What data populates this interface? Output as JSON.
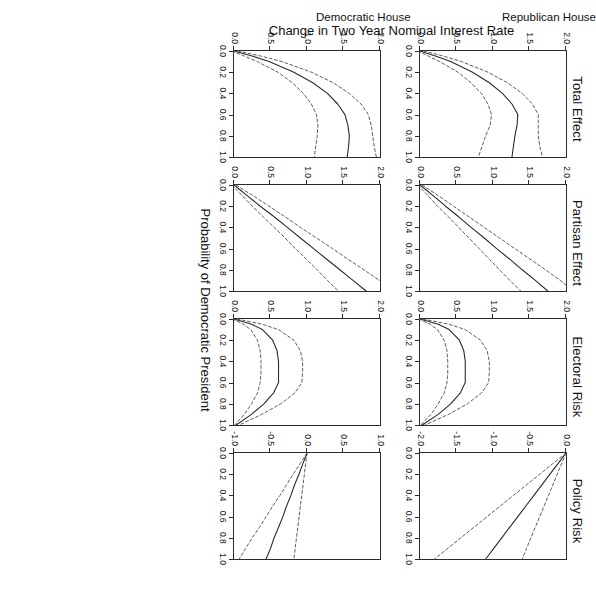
{
  "figure": {
    "xlabel": "Probability of Democratic President",
    "ylabel": "Change in Two Year Nominal Interest Rate",
    "rows": [
      {
        "id": "republican",
        "label_line1": "Republican House",
        "label_line2": ""
      },
      {
        "id": "democratic",
        "label_line1": "Democratic House",
        "label_line2": ""
      }
    ],
    "column_titles": [
      "Total Effect",
      "Partisan Effect",
      "Electoral Risk",
      "Policy Risk"
    ],
    "x_ticks": [
      "0.0",
      "0.2",
      "0.4",
      "0.6",
      "0.8",
      "1.0"
    ],
    "y_ticks_0_2": [
      "0.0",
      "0.5",
      "1.0",
      "1.5",
      "2.0"
    ],
    "y_ticks_neg2_0": [
      "0.0",
      "-0.5",
      "-1.0",
      "-1.5",
      "-2.0"
    ],
    "y_ticks_neg1_1": [
      "1.0",
      "0.5",
      "0.0",
      "-0.5",
      "-1.0"
    ],
    "line_color": "#2b2b2b",
    "band_color": "#555555"
  },
  "chart_data": {
    "type": "line",
    "title": "",
    "xlabel": "Probability of Democratic President",
    "ylabel": "Change in Two Year Nominal Interest Rate",
    "grid": false,
    "legend": "none",
    "xlim": [
      0,
      1
    ],
    "x": [
      0.0,
      0.05,
      0.1,
      0.2,
      0.3,
      0.4,
      0.5,
      0.6,
      0.7,
      0.8,
      0.9,
      1.0
    ],
    "panels": [
      {
        "row": "Republican House",
        "column": "Total Effect",
        "ylim": [
          0,
          2
        ],
        "y_ticks": [
          0.0,
          0.5,
          1.0,
          1.5,
          2.0
        ],
        "series": [
          {
            "name": "estimate",
            "style": "solid",
            "values": [
              0.0,
              0.22,
              0.42,
              0.72,
              0.95,
              1.13,
              1.26,
              1.34,
              1.33,
              1.3,
              1.28,
              1.26
            ]
          },
          {
            "name": "upper_ci",
            "style": "dashed",
            "values": [
              0.05,
              0.33,
              0.57,
              0.93,
              1.2,
              1.4,
              1.54,
              1.62,
              1.62,
              1.62,
              1.64,
              1.68
            ]
          },
          {
            "name": "lower_ci",
            "style": "dashed",
            "values": [
              -0.03,
              0.12,
              0.27,
              0.52,
              0.7,
              0.84,
              0.93,
              0.98,
              0.96,
              0.9,
              0.85,
              0.8
            ]
          }
        ]
      },
      {
        "row": "Republican House",
        "column": "Partisan Effect",
        "ylim": [
          0,
          2
        ],
        "y_ticks": [
          0.0,
          0.5,
          1.0,
          1.5,
          2.0
        ],
        "series": [
          {
            "name": "estimate",
            "style": "solid",
            "values": [
              0.0,
              0.09,
              0.18,
              0.35,
              0.53,
              0.7,
              0.88,
              1.05,
              1.23,
              1.4,
              1.58,
              1.75
            ]
          },
          {
            "name": "upper_ci",
            "style": "dashed",
            "values": [
              0.03,
              0.14,
              0.25,
              0.46,
              0.67,
              0.88,
              1.09,
              1.3,
              1.51,
              1.72,
              1.92,
              2.1
            ]
          },
          {
            "name": "lower_ci",
            "style": "dashed",
            "values": [
              -0.03,
              0.04,
              0.11,
              0.24,
              0.39,
              0.53,
              0.67,
              0.81,
              0.95,
              1.09,
              1.23,
              1.38
            ]
          }
        ]
      },
      {
        "row": "Republican House",
        "column": "Electoral Risk",
        "ylim": [
          0,
          2
        ],
        "y_ticks": [
          0.0,
          0.5,
          1.0,
          1.5,
          2.0
        ],
        "series": [
          {
            "name": "estimate",
            "style": "solid",
            "values": [
              0.0,
              0.25,
              0.4,
              0.54,
              0.6,
              0.62,
              0.62,
              0.62,
              0.55,
              0.42,
              0.25,
              0.03
            ]
          },
          {
            "name": "upper_ci",
            "style": "dashed",
            "values": [
              0.04,
              0.4,
              0.62,
              0.83,
              0.92,
              0.95,
              0.95,
              0.94,
              0.84,
              0.65,
              0.39,
              0.07
            ]
          },
          {
            "name": "lower_ci",
            "style": "dashed",
            "values": [
              -0.02,
              0.14,
              0.24,
              0.33,
              0.37,
              0.38,
              0.38,
              0.37,
              0.33,
              0.25,
              0.15,
              0.01
            ]
          }
        ]
      },
      {
        "row": "Republican House",
        "column": "Policy Risk",
        "ylim": [
          -2,
          0
        ],
        "y_ticks": [
          0.0,
          -0.5,
          -1.0,
          -1.5,
          -2.0
        ],
        "series": [
          {
            "name": "estimate",
            "style": "solid",
            "values": [
              0.0,
              -0.055,
              -0.11,
              -0.22,
              -0.33,
              -0.44,
              -0.55,
              -0.66,
              -0.77,
              -0.88,
              -0.99,
              -1.1
            ]
          },
          {
            "name": "upper_ci",
            "style": "dashed",
            "values": [
              0.0,
              -0.03,
              -0.06,
              -0.12,
              -0.18,
              -0.24,
              -0.3,
              -0.36,
              -0.42,
              -0.48,
              -0.54,
              -0.6
            ]
          },
          {
            "name": "lower_ci",
            "style": "dashed",
            "values": [
              0.0,
              -0.09,
              -0.18,
              -0.36,
              -0.54,
              -0.72,
              -0.9,
              -1.08,
              -1.26,
              -1.44,
              -1.62,
              -1.8
            ]
          }
        ]
      },
      {
        "row": "Democratic House",
        "column": "Total Effect",
        "ylim": [
          0,
          2
        ],
        "y_ticks": [
          0.0,
          0.5,
          1.0,
          1.5,
          2.0
        ],
        "series": [
          {
            "name": "estimate",
            "style": "solid",
            "values": [
              0.0,
              0.26,
              0.48,
              0.82,
              1.08,
              1.28,
              1.42,
              1.52,
              1.56,
              1.58,
              1.57,
              1.55
            ]
          },
          {
            "name": "upper_ci",
            "style": "dashed",
            "values": [
              0.05,
              0.38,
              0.66,
              1.06,
              1.36,
              1.58,
              1.74,
              1.84,
              1.88,
              1.9,
              1.92,
              1.95
            ]
          },
          {
            "name": "lower_ci",
            "style": "dashed",
            "values": [
              -0.03,
              0.15,
              0.32,
              0.6,
              0.8,
              0.95,
              1.06,
              1.13,
              1.15,
              1.14,
              1.12,
              1.1
            ]
          }
        ]
      },
      {
        "row": "Democratic House",
        "column": "Partisan Effect",
        "ylim": [
          0,
          2
        ],
        "y_ticks": [
          0.0,
          0.5,
          1.0,
          1.5,
          2.0
        ],
        "series": [
          {
            "name": "estimate",
            "style": "solid",
            "values": [
              0.0,
              0.09,
              0.18,
              0.36,
              0.55,
              0.73,
              0.91,
              1.09,
              1.27,
              1.45,
              1.63,
              1.81
            ]
          },
          {
            "name": "upper_ci",
            "style": "dashed",
            "values": [
              0.03,
              0.14,
              0.26,
              0.48,
              0.7,
              0.91,
              1.13,
              1.35,
              1.56,
              1.78,
              1.99,
              2.15
            ]
          },
          {
            "name": "lower_ci",
            "style": "dashed",
            "values": [
              -0.03,
              0.04,
              0.11,
              0.25,
              0.4,
              0.55,
              0.7,
              0.84,
              0.99,
              1.14,
              1.28,
              1.43
            ]
          }
        ]
      },
      {
        "row": "Democratic House",
        "column": "Electoral Risk",
        "ylim": [
          0,
          2
        ],
        "y_ticks": [
          0.0,
          0.5,
          1.0,
          1.5,
          2.0
        ],
        "series": [
          {
            "name": "estimate",
            "style": "solid",
            "values": [
              0.0,
              0.24,
              0.39,
              0.53,
              0.59,
              0.61,
              0.61,
              0.61,
              0.54,
              0.41,
              0.24,
              0.03
            ]
          },
          {
            "name": "upper_ci",
            "style": "dashed",
            "values": [
              0.04,
              0.39,
              0.61,
              0.82,
              0.91,
              0.94,
              0.94,
              0.93,
              0.83,
              0.64,
              0.38,
              0.07
            ]
          },
          {
            "name": "lower_ci",
            "style": "dashed",
            "values": [
              -0.02,
              0.13,
              0.23,
              0.32,
              0.36,
              0.37,
              0.37,
              0.36,
              0.32,
              0.24,
              0.14,
              0.01
            ]
          }
        ]
      },
      {
        "row": "Democratic House",
        "column": "Policy Risk",
        "ylim": [
          -1,
          1
        ],
        "y_ticks": [
          1.0,
          0.5,
          0.0,
          -0.5,
          -1.0
        ],
        "series": [
          {
            "name": "estimate",
            "style": "solid",
            "values": [
              0.0,
              -0.028,
              -0.056,
              -0.11,
              -0.17,
              -0.22,
              -0.28,
              -0.33,
              -0.39,
              -0.45,
              -0.5,
              -0.56
            ]
          },
          {
            "name": "upper_ci",
            "style": "dashed",
            "values": [
              0.0,
              -0.009,
              -0.018,
              -0.036,
              -0.054,
              -0.072,
              -0.09,
              -0.108,
              -0.126,
              -0.144,
              -0.162,
              -0.18
            ]
          },
          {
            "name": "lower_ci",
            "style": "dashed",
            "values": [
              0.0,
              -0.047,
              -0.094,
              -0.19,
              -0.28,
              -0.37,
              -0.47,
              -0.56,
              -0.65,
              -0.75,
              -0.84,
              -0.93
            ]
          }
        ]
      }
    ]
  }
}
